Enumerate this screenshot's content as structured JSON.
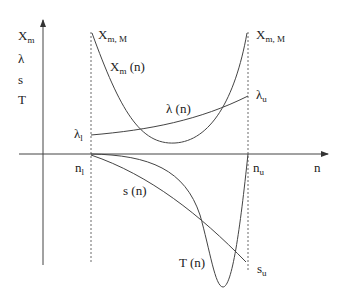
{
  "diagram": {
    "y_axis_labels": [
      "X",
      "λ",
      "s",
      "T"
    ],
    "y_axis_label_sub": {
      "X": "m"
    },
    "x_axis_label": "n",
    "left_bound": {
      "base": "n",
      "sub": "l"
    },
    "right_bound": {
      "base": "n",
      "sub": "u"
    },
    "curves": {
      "xm": {
        "label_base": "X",
        "label_sub": "m",
        "label_suffix": " (n)",
        "end_label_base": "X",
        "end_label_sub": "m, M"
      },
      "lambda": {
        "label": "λ (n)",
        "left_base": "λ",
        "left_sub": "l",
        "right_base": "λ",
        "right_sub": "u"
      },
      "s": {
        "label": "s (n)",
        "end_base": "s",
        "end_sub": "u"
      },
      "t": {
        "label": "T (n)"
      }
    },
    "stroke_color": "#333333"
  }
}
